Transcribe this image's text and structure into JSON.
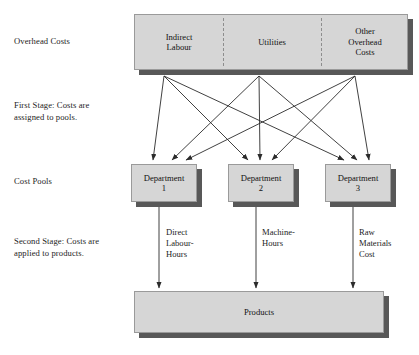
{
  "diagram": {
    "colors": {
      "box_fill": "#d6d6d6",
      "box_border": "#9a9a9a",
      "shadow": "#585858",
      "line": "#2b2b2b",
      "text": "#121212",
      "background": "#ffffff"
    },
    "stage_labels": [
      {
        "id": "overhead",
        "text": "Overhead Costs"
      },
      {
        "id": "first-stage",
        "text": "First Stage: Costs are\nassigned to pools."
      },
      {
        "id": "cost-pools",
        "text": "Cost Pools"
      },
      {
        "id": "second-stage",
        "text": "Second Stage: Costs are\napplied to products."
      }
    ],
    "overhead_costs": {
      "cells": [
        {
          "id": "indirect-labour",
          "text": "Indirect\nLabour"
        },
        {
          "id": "utilities",
          "text": "Utilities"
        },
        {
          "id": "other-overhead-costs",
          "text": "Other\nOverhead\nCosts"
        }
      ]
    },
    "cost_pools": [
      {
        "id": "department-1",
        "text": "Department\n1"
      },
      {
        "id": "department-2",
        "text": "Department\n2"
      },
      {
        "id": "department-3",
        "text": "Department\n3"
      }
    ],
    "cost_drivers": [
      {
        "id": "direct-labour-hours",
        "text": "Direct\nLabour-\nHours"
      },
      {
        "id": "machine-hours",
        "text": "Machine-\nHours"
      },
      {
        "id": "raw-materials-cost",
        "text": "Raw\nMaterials\nCost"
      }
    ],
    "products": {
      "id": "products",
      "text": "Products"
    },
    "flows": {
      "first_stage_description": "Each of the three overhead cost categories flows to each of the three departmental cost pools (nine arrows).",
      "second_stage_description": "Each departmental cost pool flows to Products via its cost driver (three arrows)."
    }
  }
}
